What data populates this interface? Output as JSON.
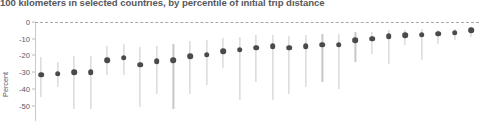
{
  "title": "100 kilometers in selected countries, by percentile of initial trip distance",
  "axis": {
    "ylabel": "Percent",
    "yticks": [
      "0",
      "-10",
      "-20",
      "-30",
      "-40",
      "-50"
    ]
  },
  "colors": {
    "title": "#58585b",
    "dot": "#4a4a4d",
    "whisker": "#c8c8ca",
    "axis": "#c9c9cb",
    "zeroline": "#a7a7aa",
    "background": "#ffffff"
  },
  "chart_data": {
    "type": "scatter",
    "title": "100 kilometers in selected countries, by percentile of initial trip distance",
    "subtitle": "",
    "xlabel": "",
    "ylabel": "Percent",
    "ylim": [
      -55,
      2
    ],
    "yticks": [
      0,
      -10,
      -20,
      -30,
      -40,
      -50
    ],
    "grid": false,
    "legend": null,
    "annotations": [
      "dashed reference line at 0"
    ],
    "x": [
      1,
      2,
      3,
      4,
      5,
      6,
      7,
      8,
      9,
      10,
      11,
      12,
      13,
      14,
      15,
      16,
      17,
      18,
      19,
      20,
      21,
      22,
      23,
      24,
      25,
      26,
      27
    ],
    "series": [
      {
        "name": "Percent change",
        "values": [
          -31.5,
          -31.0,
          -30.0,
          -30.0,
          -23.0,
          -21.5,
          -25.5,
          -23.5,
          -23.0,
          -20.5,
          -19.5,
          -17.5,
          -16.5,
          -15.5,
          -14.5,
          -15.5,
          -14.5,
          -13.5,
          -13.5,
          -11.0,
          -10.0,
          -8.5,
          -8.0,
          -7.5,
          -7.0,
          -6.5,
          -5.0
        ],
        "error_low": [
          -45.0,
          -39.0,
          -52.0,
          -52.0,
          -32.0,
          -32.0,
          -51.0,
          -43.0,
          -52.0,
          -43.0,
          -38.0,
          -27.5,
          -47.0,
          -36.0,
          -47.0,
          -43.0,
          -39.0,
          -36.0,
          -40.0,
          -24.0,
          -19.0,
          -25.0,
          -14.0,
          -23.0,
          -13.0,
          -11.0,
          -9.0
        ],
        "error_high": [
          -21.0,
          -24.0,
          -20.5,
          -20.5,
          -14.5,
          -13.0,
          -15.0,
          -14.5,
          -13.0,
          -11.5,
          -11.0,
          -9.5,
          -9.0,
          -8.0,
          -7.5,
          -8.5,
          -8.0,
          -7.0,
          -7.0,
          -6.0,
          -6.0,
          -4.5,
          -5.0,
          -4.0,
          -4.5,
          -4.0,
          -3.0
        ]
      }
    ]
  }
}
